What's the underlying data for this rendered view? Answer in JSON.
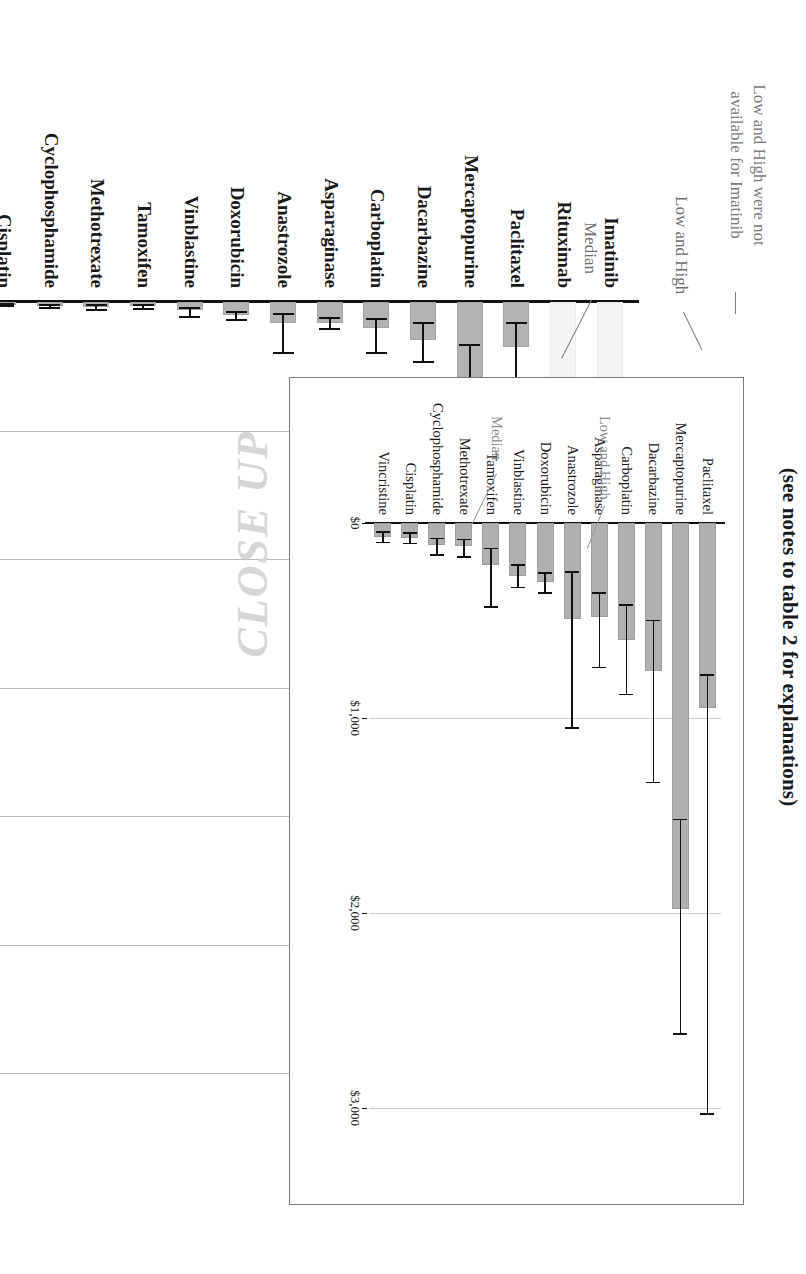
{
  "title": "(see notes to table 2 for explanations)",
  "watermark": "CLOSE UP",
  "annotations": {
    "median": "Median",
    "low_and_high": "Low and High",
    "imatinib_note": "Low and High were not\navailable for Imatinib"
  },
  "chart_data": [
    {
      "id": "main",
      "type": "bar",
      "title": "(see notes to table 2 for explanations)",
      "orientation": "vertical",
      "xlabel": "",
      "ylabel": "",
      "ylim": [
        0,
        30000
      ],
      "grid": true,
      "legend": "none",
      "tick_labels": [
        "$0",
        "$5,000",
        "$10,000",
        "$15,000",
        "$20,000",
        "$25,000",
        "$30,000"
      ],
      "ticks": [
        0,
        5000,
        10000,
        15000,
        20000,
        25000,
        30000
      ],
      "categories": [
        "Imatinib",
        "Rituximab",
        "Paclitaxel",
        "Mercaptopurine",
        "Dacarbazine",
        "Carboplatin",
        "Asparaginase",
        "Anastrozole",
        "Doxorubicin",
        "Vinblastine",
        "Tamoxifen",
        "Methotrexate",
        "Cyclophosphamide",
        "Cisplatin",
        "Vincristine"
      ],
      "series": [
        {
          "name": "Median",
          "values": [
            26900,
            18800,
            1750,
            3100,
            1480,
            1030,
            820,
            830,
            520,
            330,
            175,
            200,
            150,
            110,
            95
          ]
        },
        {
          "name": "Low",
          "values": [
            null,
            15600,
            830,
            1680,
            800,
            680,
            620,
            480,
            390,
            250,
            120,
            130,
            100,
            70,
            60
          ]
        },
        {
          "name": "High",
          "values": [
            null,
            21900,
            4400,
            4700,
            2350,
            1980,
            1050,
            2000,
            700,
            600,
            260,
            330,
            220,
            160,
            140
          ]
        }
      ]
    },
    {
      "id": "inset",
      "type": "bar",
      "title": "CLOSE UP",
      "orientation": "vertical",
      "xlabel": "",
      "ylabel": "",
      "ylim": [
        0,
        3000
      ],
      "grid": true,
      "legend": "none",
      "tick_labels": [
        "$0",
        "$1,000",
        "$2,000",
        "$3,000"
      ],
      "ticks": [
        0,
        1000,
        2000,
        3000
      ],
      "categories": [
        "Paclitaxel",
        "Mercaptopurine",
        "Dacarbazine",
        "Carboplatin",
        "Asparaginase",
        "Anastrozole",
        "Doxorubicin",
        "Vinblastine",
        "Tamoxifen",
        "Methotrexate",
        "Cyclophosphamide",
        "Cisplatin",
        "Vincristine"
      ],
      "series": [
        {
          "name": "Median",
          "values": [
            950,
            1980,
            760,
            600,
            480,
            490,
            300,
            270,
            215,
            120,
            115,
            75,
            70
          ]
        },
        {
          "name": "Low",
          "values": [
            780,
            1520,
            500,
            420,
            360,
            250,
            255,
            215,
            130,
            85,
            80,
            50,
            45
          ]
        },
        {
          "name": "High",
          "values": [
            3030,
            2620,
            1330,
            880,
            740,
            1050,
            360,
            330,
            430,
            175,
            165,
            105,
            100
          ]
        }
      ]
    }
  ]
}
